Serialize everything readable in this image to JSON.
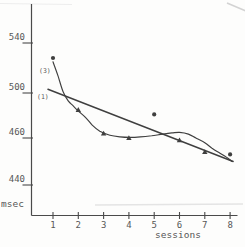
{
  "figure": {
    "ylabel_unit": "msec",
    "xlabel": "sessions"
  },
  "chart_data": {
    "type": "scatter",
    "title": "",
    "xlabel": "sessions",
    "ylabel": "msec",
    "x": [
      1,
      2,
      3,
      4,
      5,
      6,
      7,
      8
    ],
    "x_tick_labels": [
      "1",
      "2",
      "3",
      "4",
      "5",
      "6",
      "7",
      "8"
    ],
    "y_tick_values": [
      540,
      500,
      460,
      440
    ],
    "y_tick_labels": [
      "540",
      "500",
      "460",
      "440"
    ],
    "grid": false,
    "legend": "none",
    "series": [
      {
        "name": "observed-reaction-times",
        "type": "scatter",
        "values": [
          528,
          485,
          464,
          460,
          481,
          459,
          454,
          453
        ],
        "markers": [
          "dot",
          "triangle",
          "triangle",
          "triangle",
          "dot",
          "triangle",
          "triangle",
          "dot"
        ]
      },
      {
        "name": "linear-fit",
        "type": "line",
        "label": "(1)",
        "label_at": [
          0.6,
          497
        ],
        "points": [
          [
            0.8,
            503
          ],
          [
            8.12,
            450
          ]
        ]
      },
      {
        "name": "cubic-fit",
        "type": "curve",
        "label": "(3)",
        "label_at": [
          0.68,
          518
        ],
        "points": [
          [
            1.0,
            525
          ],
          [
            1.2,
            513.5
          ],
          [
            1.4,
            501
          ],
          [
            1.6,
            493
          ],
          [
            1.8,
            488.5
          ],
          [
            2.0,
            484
          ],
          [
            2.3,
            478
          ],
          [
            2.55,
            471.5
          ],
          [
            2.85,
            466
          ],
          [
            3.25,
            462.5
          ],
          [
            3.65,
            461
          ],
          [
            4.05,
            460.5
          ],
          [
            4.45,
            461
          ],
          [
            4.9,
            462
          ],
          [
            5.35,
            463.5
          ],
          [
            5.7,
            464.5
          ],
          [
            6.0,
            465
          ],
          [
            6.35,
            463.5
          ],
          [
            6.65,
            460
          ],
          [
            7.0,
            458
          ],
          [
            7.3,
            455.5
          ],
          [
            7.6,
            453.5
          ],
          [
            7.9,
            451.5
          ],
          [
            8.08,
            450
          ]
        ]
      }
    ],
    "axes": {
      "y_anchors_value_to_px": [
        [
          540,
          43
        ],
        [
          500,
          93
        ],
        [
          460,
          138
        ],
        [
          440,
          185
        ]
      ],
      "x_origin_session": 1,
      "x_origin_px": 53,
      "x_px_per_session": 25.3,
      "y_axis_x_px": 31.5,
      "x_axis_y_px": 215.5
    },
    "ink_color": "#3f3f3f",
    "axis_color": "#4a4a4a",
    "text_color": "#575757"
  }
}
